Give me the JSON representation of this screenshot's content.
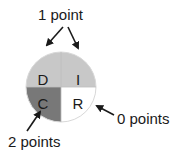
{
  "diagram": {
    "type": "quadrant-circle",
    "quadrants": [
      {
        "id": "D",
        "label": "D",
        "position": "top-left",
        "fill": "#c8c8c8",
        "points": 1
      },
      {
        "id": "I",
        "label": "I",
        "position": "top-right",
        "fill": "#c8c8c8",
        "points": 1
      },
      {
        "id": "C",
        "label": "C",
        "position": "bottom-left",
        "fill": "#787878",
        "points": 2
      },
      {
        "id": "R",
        "label": "R",
        "position": "bottom-right",
        "fill": "#ffffff",
        "points": 0
      }
    ],
    "annotations": {
      "one_point": "1 point",
      "zero_points": "0 points",
      "two_points": "2 points"
    }
  }
}
